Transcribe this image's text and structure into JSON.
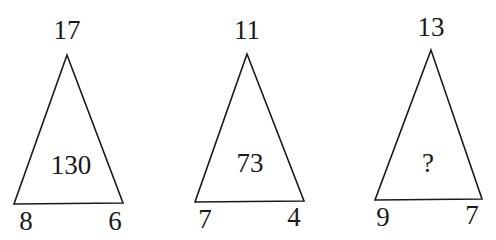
{
  "diagram": {
    "type": "number-triangle-puzzle",
    "triangles": [
      {
        "top": "17",
        "bottom_left": "8",
        "bottom_right": "6",
        "center": "130"
      },
      {
        "top": "11",
        "bottom_left": "7",
        "bottom_right": "4",
        "center": "73"
      },
      {
        "top": "13",
        "bottom_left": "9",
        "bottom_right": "7",
        "center": "?"
      }
    ]
  },
  "colors": {
    "stroke": "#1a1a1a",
    "text": "#1a1a1a",
    "background": "#ffffff"
  }
}
